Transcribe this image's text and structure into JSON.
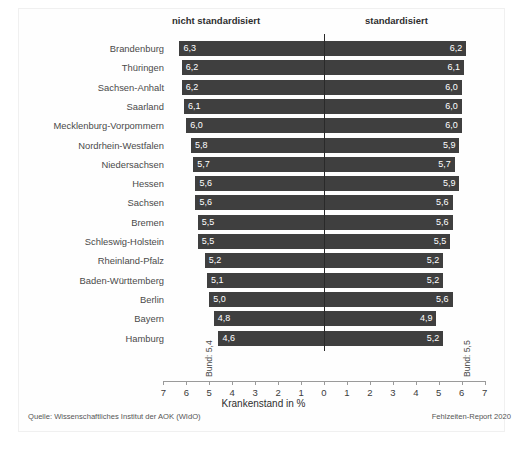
{
  "figure": {
    "headers": {
      "left": "nicht standardisiert",
      "right": "standardisiert"
    },
    "axis_title": "Krankenstand in %",
    "bund_left": "Bund: 5,4",
    "bund_right": "Bund: 5,5",
    "source": "Quelle: Wissenschaftliches Institut der AOK (WIdO)",
    "report": "Fehlzeiten-Report 2020"
  },
  "chart_data": {
    "type": "bar",
    "orientation": "horizontal-diverging",
    "title": "",
    "xlabel": "Krankenstand in %",
    "ylabel": "",
    "xlim": [
      -7,
      7
    ],
    "grid": false,
    "legend_position": "top",
    "tick_labels": [
      "7",
      "6",
      "5",
      "4",
      "3",
      "2",
      "1",
      "0",
      "1",
      "2",
      "3",
      "4",
      "5",
      "6",
      "7"
    ],
    "tick_values": [
      -7,
      -6,
      -5,
      -4,
      -3,
      -2,
      -1,
      0,
      1,
      2,
      3,
      4,
      5,
      6,
      7
    ],
    "categories": [
      "Brandenburg",
      "Thüringen",
      "Sachsen-Anhalt",
      "Saarland",
      "Mecklenburg-Vorpommern",
      "Nordrhein-Westfalen",
      "Niedersachsen",
      "Hessen",
      "Sachsen",
      "Bremen",
      "Schleswig-Holstein",
      "Rheinland-Pfalz",
      "Baden-Württemberg",
      "Berlin",
      "Bayern",
      "Hamburg"
    ],
    "series": [
      {
        "name": "nicht standardisiert",
        "side": "left",
        "values": [
          6.3,
          6.2,
          6.2,
          6.1,
          6.0,
          5.8,
          5.7,
          5.6,
          5.6,
          5.5,
          5.5,
          5.2,
          5.1,
          5.0,
          4.8,
          4.6
        ],
        "labels": [
          "6,3",
          "6,2",
          "6,2",
          "6,1",
          "6,0",
          "5,8",
          "5,7",
          "5,6",
          "5,6",
          "5,5",
          "5,5",
          "5,2",
          "5,1",
          "5,0",
          "4,8",
          "4,6"
        ]
      },
      {
        "name": "standardisiert",
        "side": "right",
        "values": [
          6.2,
          6.1,
          6.0,
          6.0,
          6.0,
          5.9,
          5.7,
          5.9,
          5.6,
          5.6,
          5.5,
          5.2,
          5.2,
          5.6,
          4.9,
          5.2
        ],
        "labels": [
          "6,2",
          "6,1",
          "6,0",
          "6,0",
          "6,0",
          "5,9",
          "5,7",
          "5,9",
          "5,6",
          "5,6",
          "5,5",
          "5,2",
          "5,2",
          "5,6",
          "4,9",
          "5,2"
        ]
      }
    ],
    "reference_lines": [
      {
        "name": "Bund (nicht standardisiert)",
        "label": "Bund: 5,4",
        "value": 5.4,
        "side": "left"
      },
      {
        "name": "Bund (standardisiert)",
        "label": "Bund: 5,5",
        "value": 5.5,
        "side": "right"
      }
    ],
    "colors": {
      "bar": "#3f3f3f",
      "value_label": "#ffffff",
      "axis": "#9a9a9a",
      "zero_line": "#2a2a2a"
    }
  }
}
